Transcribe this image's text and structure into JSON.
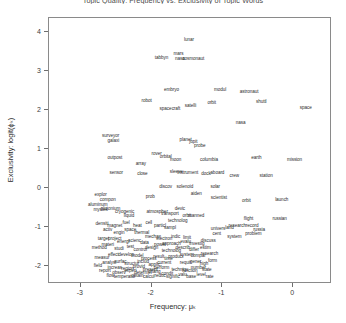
{
  "chart_data": {
    "type": "scatter",
    "title": "Topic Quality: Frequency vs. Exclusivity of Topic Words",
    "xlabel": "Frequency: μₖ",
    "ylabel": "Exclusivity: logit(ϕₖ)",
    "xlim": [
      -3.45,
      0.55
    ],
    "ylim": [
      -2.45,
      4.35
    ],
    "xticks": [
      -3,
      -2,
      -1,
      0
    ],
    "yticks": [
      -2,
      -1,
      0,
      1,
      2,
      3,
      4
    ],
    "grid": false,
    "legend": null,
    "point_style": "text-label",
    "points": [
      {
        "label": "lunar",
        "x": -1.47,
        "y": 3.78
      },
      {
        "label": "tabbyn",
        "x": -1.86,
        "y": 3.33
      },
      {
        "label": "mars",
        "x": -1.62,
        "y": 3.44
      },
      {
        "label": "nasa",
        "x": -1.6,
        "y": 3.3
      },
      {
        "label": "cosmonaut",
        "x": -1.41,
        "y": 3.3
      },
      {
        "label": "embryo",
        "x": -1.72,
        "y": 2.52
      },
      {
        "label": "modul",
        "x": -1.03,
        "y": 2.5
      },
      {
        "label": "astronaut",
        "x": -0.62,
        "y": 2.45
      },
      {
        "label": "robot",
        "x": -2.07,
        "y": 2.23
      },
      {
        "label": "orbit",
        "x": -1.15,
        "y": 2.18
      },
      {
        "label": "shuttl",
        "x": -0.45,
        "y": 2.19
      },
      {
        "label": "space",
        "x": 0.18,
        "y": 2.06
      },
      {
        "label": "spacecraft",
        "x": -1.74,
        "y": 2.03
      },
      {
        "label": "satelli",
        "x": -1.45,
        "y": 2.09
      },
      {
        "label": "nasa",
        "x": -0.74,
        "y": 1.67
      },
      {
        "label": "surveyor",
        "x": -2.58,
        "y": 1.33
      },
      {
        "label": "galaxi",
        "x": -2.54,
        "y": 1.21
      },
      {
        "label": "planet",
        "x": -1.52,
        "y": 1.22
      },
      {
        "label": "jupit",
        "x": -1.41,
        "y": 1.19
      },
      {
        "label": "probe",
        "x": -1.32,
        "y": 1.08
      },
      {
        "label": "outpost",
        "x": -2.52,
        "y": 0.76
      },
      {
        "label": "rover",
        "x": -1.93,
        "y": 0.87
      },
      {
        "label": "orbital",
        "x": -1.8,
        "y": 0.8
      },
      {
        "label": "moon",
        "x": -1.66,
        "y": 0.72
      },
      {
        "label": "columbia",
        "x": -1.19,
        "y": 0.73
      },
      {
        "label": "earth",
        "x": -0.52,
        "y": 0.76
      },
      {
        "label": "mission",
        "x": 0.02,
        "y": 0.72
      },
      {
        "label": "array",
        "x": -2.15,
        "y": 0.63
      },
      {
        "label": "sensor",
        "x": -2.5,
        "y": 0.38
      },
      {
        "label": "close",
        "x": -2.13,
        "y": 0.35
      },
      {
        "label": "sleeve",
        "x": -1.65,
        "y": 0.42
      },
      {
        "label": "instrument",
        "x": -1.49,
        "y": 0.38
      },
      {
        "label": "dock",
        "x": -1.23,
        "y": 0.35
      },
      {
        "label": "aboard",
        "x": -1.07,
        "y": 0.38
      },
      {
        "label": "crew",
        "x": -0.83,
        "y": 0.3
      },
      {
        "label": "station",
        "x": -0.38,
        "y": 0.3
      },
      {
        "label": "discov",
        "x": -1.8,
        "y": 0.02
      },
      {
        "label": "solenoid",
        "x": -1.53,
        "y": 0.04
      },
      {
        "label": "solar",
        "x": -1.1,
        "y": 0.04
      },
      {
        "label": "explor",
        "x": -2.72,
        "y": -0.18
      },
      {
        "label": "compon",
        "x": -2.62,
        "y": -0.3
      },
      {
        "label": "aluminum",
        "x": -2.76,
        "y": -0.42
      },
      {
        "label": "mystek",
        "x": -2.72,
        "y": -0.56
      },
      {
        "label": "prob",
        "x": -2.02,
        "y": -0.22
      },
      {
        "label": "aiden",
        "x": -1.37,
        "y": -0.14
      },
      {
        "label": "scientist",
        "x": -1.05,
        "y": -0.24
      },
      {
        "label": "orbit",
        "x": -0.66,
        "y": -0.34
      },
      {
        "label": "launch",
        "x": -0.16,
        "y": -0.3
      },
      {
        "label": "plutonium",
        "x": -2.58,
        "y": -0.54
      },
      {
        "label": "cryogenic",
        "x": -2.38,
        "y": -0.62
      },
      {
        "label": "atmospher",
        "x": -1.92,
        "y": -0.6
      },
      {
        "label": "liquid",
        "x": -2.32,
        "y": -0.72
      },
      {
        "label": "devic",
        "x": -1.6,
        "y": -0.54
      },
      {
        "label": "transport",
        "x": -1.74,
        "y": -0.66
      },
      {
        "label": "orbit",
        "x": -1.5,
        "y": -0.7
      },
      {
        "label": "technolog",
        "x": -1.63,
        "y": -0.84
      },
      {
        "label": "manned",
        "x": -1.37,
        "y": -0.72
      },
      {
        "label": "flight",
        "x": -0.63,
        "y": -0.78
      },
      {
        "label": "russian",
        "x": -0.19,
        "y": -0.8
      },
      {
        "label": "research",
        "x": -0.79,
        "y": -0.96
      },
      {
        "label": "record",
        "x": -0.58,
        "y": -0.96
      },
      {
        "label": "univers",
        "x": -1.06,
        "y": -1.04
      },
      {
        "label": "land",
        "x": -0.9,
        "y": -1.02
      },
      {
        "label": "russia",
        "x": -0.48,
        "y": -1.06
      },
      {
        "label": "cent",
        "x": -1.08,
        "y": -1.16
      },
      {
        "label": "problem",
        "x": -0.56,
        "y": -1.18
      },
      {
        "label": "system",
        "x": -0.83,
        "y": -1.26
      },
      {
        "label": "target",
        "x": -2.68,
        "y": -1.3
      },
      {
        "label": "project",
        "x": -2.52,
        "y": -1.3
      },
      {
        "label": "energi",
        "x": -2.4,
        "y": -1.38
      },
      {
        "label": "scienc",
        "x": -2.24,
        "y": -1.34
      },
      {
        "label": "data",
        "x": -2.1,
        "y": -1.4
      },
      {
        "label": "test",
        "x": -2.3,
        "y": -1.5
      },
      {
        "label": "materi",
        "x": -2.62,
        "y": -1.46
      },
      {
        "label": "method",
        "x": -2.74,
        "y": -1.52
      },
      {
        "label": "studi",
        "x": -2.46,
        "y": -1.56
      },
      {
        "label": "control",
        "x": -2.16,
        "y": -1.58
      },
      {
        "label": "design",
        "x": -2.0,
        "y": -1.52
      },
      {
        "label": "power",
        "x": -1.88,
        "y": -1.46
      },
      {
        "label": "technolog",
        "x": -1.72,
        "y": -1.6
      },
      {
        "label": "develop",
        "x": -2.36,
        "y": -1.72
      },
      {
        "label": "effect",
        "x": -2.54,
        "y": -1.7
      },
      {
        "label": "measur",
        "x": -2.7,
        "y": -1.78
      },
      {
        "label": "model",
        "x": -2.2,
        "y": -1.74
      },
      {
        "label": "process",
        "x": -2.04,
        "y": -1.8
      },
      {
        "label": "result",
        "x": -1.9,
        "y": -1.76
      },
      {
        "label": "time",
        "x": -1.76,
        "y": -1.82
      },
      {
        "label": "surfac",
        "x": -2.44,
        "y": -1.88
      },
      {
        "label": "analysi",
        "x": -2.6,
        "y": -1.92
      },
      {
        "label": "structur",
        "x": -2.28,
        "y": -1.94
      },
      {
        "label": "includ",
        "x": -2.12,
        "y": -1.9
      },
      {
        "label": "applic",
        "x": -1.96,
        "y": -1.96
      },
      {
        "label": "current",
        "x": -1.82,
        "y": -1.92
      },
      {
        "label": "field",
        "x": -2.76,
        "y": -1.98
      },
      {
        "label": "increas",
        "x": -2.52,
        "y": -2.04
      },
      {
        "label": "region",
        "x": -2.34,
        "y": -2.06
      },
      {
        "label": "provid",
        "x": -2.18,
        "y": -2.02
      },
      {
        "label": "present",
        "x": -2.02,
        "y": -2.08
      },
      {
        "label": "perform",
        "x": -1.86,
        "y": -2.04
      },
      {
        "label": "report",
        "x": -2.66,
        "y": -2.12
      },
      {
        "label": "observ",
        "x": -2.46,
        "y": -2.16
      },
      {
        "label": "experi",
        "x": -2.3,
        "y": -2.12
      },
      {
        "label": "determin",
        "x": -2.12,
        "y": -2.18
      },
      {
        "label": "chang",
        "x": -1.96,
        "y": -2.14
      },
      {
        "label": "condit",
        "x": -1.78,
        "y": -2.2
      },
      {
        "label": "flow",
        "x": -2.58,
        "y": -2.24
      },
      {
        "label": "temperatur",
        "x": -2.38,
        "y": -2.26
      },
      {
        "label": "obtain",
        "x": -2.2,
        "y": -2.24
      },
      {
        "label": "calcul",
        "x": -2.04,
        "y": -2.28
      },
      {
        "label": "reduc",
        "x": -1.88,
        "y": -2.24
      },
      {
        "label": "signific",
        "x": -1.7,
        "y": -2.28
      },
      {
        "label": "valu",
        "x": -1.56,
        "y": -2.22
      },
      {
        "label": "base",
        "x": -1.44,
        "y": -2.26
      },
      {
        "label": "level",
        "x": -1.3,
        "y": -2.22
      },
      {
        "label": "rate",
        "x": -1.18,
        "y": -2.28
      },
      {
        "label": "techniqu",
        "x": -1.6,
        "y": -2.08
      },
      {
        "label": "function",
        "x": -1.46,
        "y": -2.12
      },
      {
        "label": "number",
        "x": -1.34,
        "y": -2.04
      },
      {
        "label": "state",
        "x": -1.22,
        "y": -2.1
      },
      {
        "label": "requir",
        "x": -1.52,
        "y": -1.92
      },
      {
        "label": "gener",
        "x": -1.38,
        "y": -1.88
      },
      {
        "label": "high",
        "x": -1.26,
        "y": -1.94
      },
      {
        "label": "form",
        "x": -1.14,
        "y": -1.86
      },
      {
        "label": "product",
        "x": -1.66,
        "y": -1.76
      },
      {
        "label": "system",
        "x": -1.5,
        "y": -1.7
      },
      {
        "label": "compar",
        "x": -1.34,
        "y": -1.74
      },
      {
        "label": "research",
        "x": -1.18,
        "y": -1.68
      },
      {
        "label": "describ",
        "x": -1.56,
        "y": -1.54
      },
      {
        "label": "differ",
        "x": -1.4,
        "y": -1.58
      },
      {
        "label": "estim",
        "x": -1.24,
        "y": -1.52
      },
      {
        "label": "approach",
        "x": -1.72,
        "y": -1.44
      },
      {
        "label": "evalu",
        "x": -1.52,
        "y": -1.38
      },
      {
        "label": "investig",
        "x": -1.36,
        "y": -1.44
      },
      {
        "label": "discuss",
        "x": -1.2,
        "y": -1.36
      },
      {
        "label": "mechan",
        "x": -1.98,
        "y": -1.24
      },
      {
        "label": "electron",
        "x": -1.82,
        "y": -1.3
      },
      {
        "label": "indic",
        "x": -1.66,
        "y": -1.24
      },
      {
        "label": "limit",
        "x": -1.5,
        "y": -1.28
      },
      {
        "label": "activ",
        "x": -2.62,
        "y": -1.08
      },
      {
        "label": "engin",
        "x": -2.46,
        "y": -1.14
      },
      {
        "label": "space",
        "x": -2.3,
        "y": -1.08
      },
      {
        "label": "thermal",
        "x": -2.14,
        "y": -1.14
      },
      {
        "label": "densiti",
        "x": -2.7,
        "y": -0.92
      },
      {
        "label": "magnet",
        "x": -2.52,
        "y": -0.96
      },
      {
        "label": "fuel",
        "x": -2.36,
        "y": -0.9
      },
      {
        "label": "heat",
        "x": -2.2,
        "y": -0.96
      },
      {
        "label": "cell",
        "x": -2.04,
        "y": -0.9
      },
      {
        "label": "particl",
        "x": -1.88,
        "y": -0.96
      },
      {
        "label": "sampl",
        "x": -1.74,
        "y": -1.02
      }
    ]
  }
}
